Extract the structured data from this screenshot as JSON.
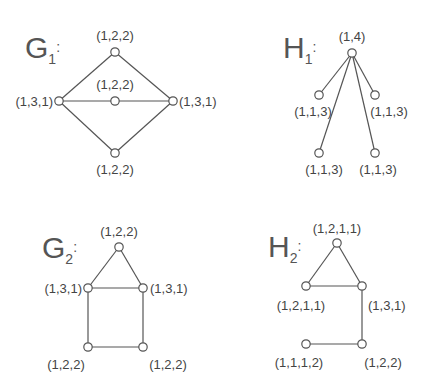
{
  "graphs": [
    {
      "name": "G",
      "subscript": "1",
      "title_pos": [
        25,
        58
      ],
      "nodes": [
        {
          "id": "g1_top",
          "x": 115,
          "y": 52,
          "label": "(1,2,2)",
          "lx": 115,
          "ly": 40,
          "anchor": "middle"
        },
        {
          "id": "g1_mid",
          "x": 115,
          "y": 101,
          "label": "(1,2,2)",
          "lx": 115,
          "ly": 89,
          "anchor": "middle"
        },
        {
          "id": "g1_left",
          "x": 59,
          "y": 101,
          "label": "(1,3,1)",
          "lx": 53,
          "ly": 106,
          "anchor": "end"
        },
        {
          "id": "g1_right",
          "x": 173,
          "y": 101,
          "label": "(1,3,1)",
          "lx": 179,
          "ly": 106,
          "anchor": "start"
        },
        {
          "id": "g1_bottom",
          "x": 115,
          "y": 153,
          "label": "(1,2,2)",
          "lx": 115,
          "ly": 174,
          "anchor": "middle"
        }
      ],
      "edges": [
        [
          "g1_left",
          "g1_top"
        ],
        [
          "g1_top",
          "g1_right"
        ],
        [
          "g1_left",
          "g1_mid"
        ],
        [
          "g1_mid",
          "g1_right"
        ],
        [
          "g1_left",
          "g1_bottom"
        ],
        [
          "g1_bottom",
          "g1_right"
        ]
      ]
    },
    {
      "name": "H",
      "subscript": "1",
      "title_pos": [
        283,
        58
      ],
      "nodes": [
        {
          "id": "h1_top",
          "x": 352,
          "y": 53,
          "label": "(1,4)",
          "lx": 352,
          "ly": 41,
          "anchor": "middle"
        },
        {
          "id": "h1_lm",
          "x": 319,
          "y": 95,
          "label": "(1,1,3)",
          "lx": 313,
          "ly": 116,
          "anchor": "middle"
        },
        {
          "id": "h1_rm",
          "x": 375,
          "y": 95,
          "label": "(1,1,3)",
          "lx": 389,
          "ly": 116,
          "anchor": "middle"
        },
        {
          "id": "h1_bl",
          "x": 319,
          "y": 153,
          "label": "(1,1,3)",
          "lx": 324,
          "ly": 174,
          "anchor": "middle"
        },
        {
          "id": "h1_br",
          "x": 375,
          "y": 153,
          "label": "(1,1,3)",
          "lx": 378,
          "ly": 174,
          "anchor": "middle"
        }
      ],
      "edges": [
        [
          "h1_top",
          "h1_lm"
        ],
        [
          "h1_top",
          "h1_rm"
        ],
        [
          "h1_top",
          "h1_bl"
        ],
        [
          "h1_top",
          "h1_br"
        ]
      ]
    },
    {
      "name": "G",
      "subscript": "2",
      "title_pos": [
        42,
        258
      ],
      "nodes": [
        {
          "id": "g2_top",
          "x": 119,
          "y": 247,
          "label": "(1,2,2)",
          "lx": 119,
          "ly": 236,
          "anchor": "middle"
        },
        {
          "id": "g2_left",
          "x": 88,
          "y": 288,
          "label": "(1,3,1)",
          "lx": 82,
          "ly": 293,
          "anchor": "end"
        },
        {
          "id": "g2_right",
          "x": 143,
          "y": 288,
          "label": "(1,3,1)",
          "lx": 150,
          "ly": 293,
          "anchor": "start"
        },
        {
          "id": "g2_bl",
          "x": 88,
          "y": 347,
          "label": "(1,2,2)",
          "lx": 66,
          "ly": 369,
          "anchor": "middle"
        },
        {
          "id": "g2_br",
          "x": 143,
          "y": 347,
          "label": "(1,2,2)",
          "lx": 168,
          "ly": 369,
          "anchor": "middle"
        }
      ],
      "edges": [
        [
          "g2_top",
          "g2_left"
        ],
        [
          "g2_top",
          "g2_right"
        ],
        [
          "g2_left",
          "g2_right"
        ],
        [
          "g2_left",
          "g2_bl"
        ],
        [
          "g2_right",
          "g2_br"
        ],
        [
          "g2_bl",
          "g2_br"
        ]
      ]
    },
    {
      "name": "H",
      "subscript": "2",
      "title_pos": [
        268,
        257
      ],
      "nodes": [
        {
          "id": "h2_top",
          "x": 337,
          "y": 243,
          "label": "(1,2,1,1)",
          "lx": 337,
          "ly": 233,
          "anchor": "middle"
        },
        {
          "id": "h2_left",
          "x": 306,
          "y": 286,
          "label": "(1,2,1,1)",
          "lx": 301,
          "ly": 310,
          "anchor": "middle"
        },
        {
          "id": "h2_right",
          "x": 362,
          "y": 286,
          "label": "(1,3,1)",
          "lx": 368,
          "ly": 310,
          "anchor": "start"
        },
        {
          "id": "h2_br",
          "x": 362,
          "y": 344,
          "label": "(1,2,2)",
          "lx": 383,
          "ly": 367,
          "anchor": "middle"
        },
        {
          "id": "h2_bl",
          "x": 306,
          "y": 344,
          "label": "(1,1,1,2)",
          "lx": 299,
          "ly": 367,
          "anchor": "middle"
        }
      ],
      "edges": [
        [
          "h2_top",
          "h2_left"
        ],
        [
          "h2_top",
          "h2_right"
        ],
        [
          "h2_left",
          "h2_right"
        ],
        [
          "h2_right",
          "h2_br"
        ],
        [
          "h2_br",
          "h2_bl"
        ]
      ]
    }
  ]
}
